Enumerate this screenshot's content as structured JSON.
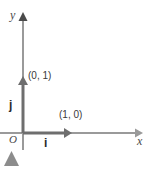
{
  "figure": {
    "type": "vector-diagram",
    "background_color": "#ffffff",
    "axis_color": "#9a9a9a",
    "vector_color": "#6e6e6e",
    "text_color": "#3a3a3a",
    "artifact_color": "#8c8c8c"
  },
  "axes": {
    "x_label": "x",
    "y_label": "y",
    "origin_label": "O",
    "origin_px": {
      "x": 23,
      "y": 133
    },
    "x_axis_start_px": {
      "x": 0,
      "y": 133
    },
    "x_axis_end_px": {
      "x": 143,
      "y": 133
    },
    "y_axis_top_px": {
      "x": 23,
      "y": 13
    },
    "y_axis_bottom_px": {
      "x": 23,
      "y": 150
    }
  },
  "vectors": [
    {
      "name": "i",
      "label": "i",
      "coordinate_label": "(1, 0)",
      "from_px": {
        "x": 23,
        "y": 133
      },
      "to_px": {
        "x": 72,
        "y": 133
      },
      "components": [
        1,
        0
      ]
    },
    {
      "name": "j",
      "label": "j",
      "coordinate_label": "(0, 1)",
      "from_px": {
        "x": 23,
        "y": 133
      },
      "to_px": {
        "x": 23,
        "y": 76
      },
      "components": [
        0,
        1
      ]
    }
  ],
  "artifact": {
    "name": "triangle-marker",
    "shape": "triangle",
    "px": {
      "x": 4,
      "y": 151,
      "width": 15,
      "height": 15
    }
  }
}
